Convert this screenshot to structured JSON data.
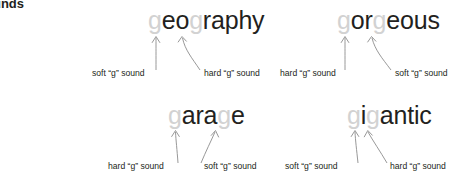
{
  "page": {
    "heading": "“g” sounds",
    "body_lines": [
      "t include",
      "nd. There",
      "glish that"
    ],
    "colors": {
      "text": "#231f20",
      "highlight_letter": "#d2d2d2",
      "arrow": "#808080",
      "background": "#ffffff"
    }
  },
  "examples": [
    {
      "id": "geography",
      "word": "geography",
      "segments": [
        {
          "text": "g",
          "highlight": true
        },
        {
          "text": "eo",
          "highlight": false
        },
        {
          "text": "g",
          "highlight": true
        },
        {
          "text": "raphy",
          "highlight": false
        }
      ],
      "labels": [
        {
          "text": "soft “g” sound",
          "target": "g1"
        },
        {
          "text": "hard “g” sound",
          "target": "g2"
        }
      ]
    },
    {
      "id": "gorgeous",
      "word": "gorgeous",
      "segments": [
        {
          "text": "g",
          "highlight": true
        },
        {
          "text": "or",
          "highlight": false
        },
        {
          "text": "g",
          "highlight": true
        },
        {
          "text": "eous",
          "highlight": false
        }
      ],
      "labels": [
        {
          "text": "hard “g” sound",
          "target": "g1"
        },
        {
          "text": "soft “g” sound",
          "target": "g2"
        }
      ]
    },
    {
      "id": "garage",
      "word": "garage",
      "segments": [
        {
          "text": "g",
          "highlight": true
        },
        {
          "text": "ara",
          "highlight": false
        },
        {
          "text": "g",
          "highlight": true
        },
        {
          "text": "e",
          "highlight": false
        }
      ],
      "labels": [
        {
          "text": "hard “g” sound",
          "target": "g1"
        },
        {
          "text": "soft “g” sound",
          "target": "g2"
        }
      ]
    },
    {
      "id": "gigantic",
      "word": "gigantic",
      "segments": [
        {
          "text": "g",
          "highlight": true
        },
        {
          "text": "i",
          "highlight": false
        },
        {
          "text": "g",
          "highlight": true
        },
        {
          "text": "antic",
          "highlight": false
        }
      ],
      "labels": [
        {
          "text": "soft “g” sound",
          "target": "g1"
        },
        {
          "text": "hard “g” sound",
          "target": "g2"
        }
      ]
    }
  ]
}
